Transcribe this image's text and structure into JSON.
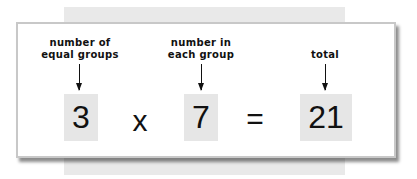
{
  "equation": {
    "terms": [
      {
        "label": "number of\nequal groups",
        "value": "3"
      },
      {
        "label": "number in\neach group",
        "value": "7"
      },
      {
        "label": "total",
        "value": "21"
      }
    ],
    "operators": {
      "multiply": "x",
      "equals": "="
    }
  },
  "colors": {
    "box": "#e6e6e6",
    "band": "#e9e9e9",
    "border": "#c8c8c8"
  }
}
